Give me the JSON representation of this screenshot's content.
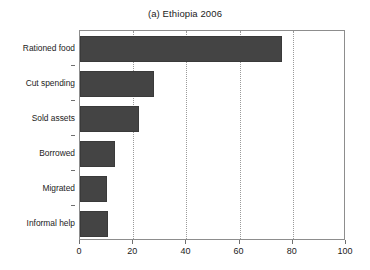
{
  "chart_data": {
    "type": "bar",
    "orientation": "horizontal",
    "title": "(a) Ethiopia 2006",
    "xlabel": "",
    "ylabel": "",
    "categories": [
      "Rationed food",
      "Cut spending",
      "Sold assets",
      "Borrowed",
      "Migrated",
      "Informal help"
    ],
    "values": [
      76,
      28,
      22,
      13,
      10,
      10.5
    ],
    "xlim": [
      0,
      100
    ],
    "xticks": [
      0,
      20,
      40,
      60,
      80,
      100
    ],
    "xtick_labels": [
      "0",
      "20",
      "40",
      "60",
      "80",
      "100"
    ],
    "grid": "vertical-dotted",
    "legend": "none",
    "bar_color": "#444444",
    "frame_color": "#8d8d8d",
    "gridline_color": "#9a9a9a",
    "background": "#ffffff",
    "text_color": "#1b1b1b"
  }
}
